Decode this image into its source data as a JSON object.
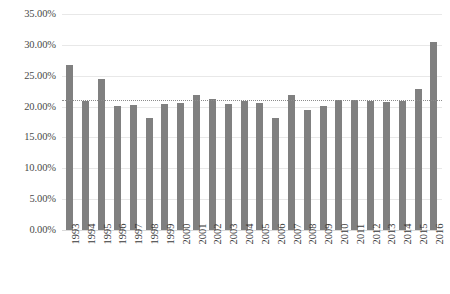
{
  "chart_data": {
    "type": "bar",
    "title": "",
    "xlabel": "",
    "ylabel": "",
    "ylim": [
      0,
      35
    ],
    "ytick_labels": [
      "35.00%",
      "30.00%",
      "25.00%",
      "20.00%",
      "15.00%",
      "10.00%",
      "5.00%",
      "0.00%"
    ],
    "ytick_values": [
      35,
      30,
      25,
      20,
      15,
      10,
      5,
      0
    ],
    "grid": true,
    "legend": "none",
    "bar_color": "#808080",
    "gridline_color": "#e8e8e8",
    "categories": [
      "1993",
      "1994",
      "1995",
      "1996",
      "1997",
      "1998",
      "1999",
      "2000",
      "2001",
      "2002",
      "2003",
      "2004",
      "2005",
      "2006",
      "2007",
      "2008",
      "2009",
      "2010",
      "2011",
      "2012",
      "2013",
      "2014",
      "2015",
      "2016"
    ],
    "values": [
      26.7,
      20.9,
      24.5,
      20.1,
      20.3,
      18.2,
      20.5,
      20.6,
      21.9,
      21.3,
      20.5,
      20.9,
      20.6,
      18.1,
      21.8,
      19.4,
      20.1,
      21.0,
      21.1,
      20.9,
      20.7,
      20.9,
      22.8,
      30.5
    ],
    "annotations": [
      {
        "name": "average-trendline",
        "type": "horizontal-dotted-line",
        "value": 21.1,
        "color": "#8c8c8c",
        "style": "dotted"
      }
    ]
  },
  "caption": {
    "text": ""
  }
}
